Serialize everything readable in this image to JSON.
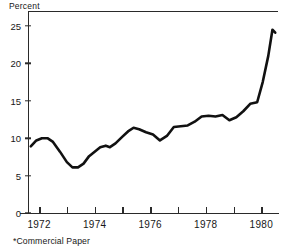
{
  "chart_data": {
    "type": "line",
    "title": "",
    "subtitle": "",
    "ylabel": "Percent",
    "xlabel": "",
    "footnote": "*Commercial Paper",
    "ylim": [
      0,
      27
    ],
    "xlim": [
      1971.6,
      1980.6
    ],
    "grid": false,
    "legend": false,
    "yticks": [
      0,
      5,
      10,
      15,
      20,
      25
    ],
    "ytick_labels": [
      "0",
      "5",
      "10",
      "15",
      "20",
      "25"
    ],
    "xticks": [
      1972,
      1973,
      1974,
      1975,
      1976,
      1977,
      1978,
      1979,
      1980
    ],
    "xtick_labels_shown": [
      "1972",
      "1974",
      "1976",
      "1978",
      "1980"
    ],
    "xtick_labeled_values": [
      1972,
      1974,
      1976,
      1978,
      1980
    ],
    "line_color": "#111111",
    "line_width": 2.6,
    "series": [
      {
        "name": "Commercial Paper rate",
        "x": [
          1971.7,
          1971.9,
          1972.1,
          1972.3,
          1972.5,
          1972.75,
          1973.0,
          1973.2,
          1973.4,
          1973.6,
          1973.8,
          1974.0,
          1974.2,
          1974.4,
          1974.55,
          1974.75,
          1975.0,
          1975.2,
          1975.4,
          1975.6,
          1975.85,
          1976.1,
          1976.35,
          1976.6,
          1976.85,
          1977.1,
          1977.35,
          1977.6,
          1977.85,
          1978.1,
          1978.35,
          1978.6,
          1978.85,
          1979.1,
          1979.35,
          1979.6,
          1979.85,
          1980.05,
          1980.25,
          1980.4,
          1980.5
        ],
        "y": [
          8.9,
          9.7,
          10.0,
          10.0,
          9.5,
          8.2,
          6.8,
          6.1,
          6.1,
          6.6,
          7.6,
          8.2,
          8.8,
          9.0,
          8.8,
          9.3,
          10.2,
          10.9,
          11.4,
          11.2,
          10.8,
          10.5,
          9.7,
          10.3,
          11.5,
          11.6,
          11.7,
          12.2,
          12.9,
          13.0,
          12.9,
          13.1,
          12.4,
          12.8,
          13.6,
          14.6,
          14.8,
          17.5,
          21.0,
          24.5,
          24.1
        ],
        "y_start": 8.9,
        "y_min": 6.1,
        "y_max": 24.5,
        "y_end": 24.1
      }
    ],
    "annotations": []
  }
}
